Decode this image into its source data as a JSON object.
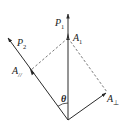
{
  "diagram": {
    "type": "vector-decomposition",
    "colors": {
      "line": "#2a2a2a",
      "dashed": "#555555",
      "background": "#ffffff"
    },
    "labels": {
      "p1": {
        "main": "P",
        "sub": "1"
      },
      "p2": {
        "main": "P",
        "sub": "2"
      },
      "a1": {
        "main": "A",
        "sub": "1"
      },
      "a_parallel": {
        "main": "A",
        "sub": "//"
      },
      "a_perp": {
        "main": "A",
        "sub": "⊥"
      },
      "theta": "θ"
    }
  }
}
